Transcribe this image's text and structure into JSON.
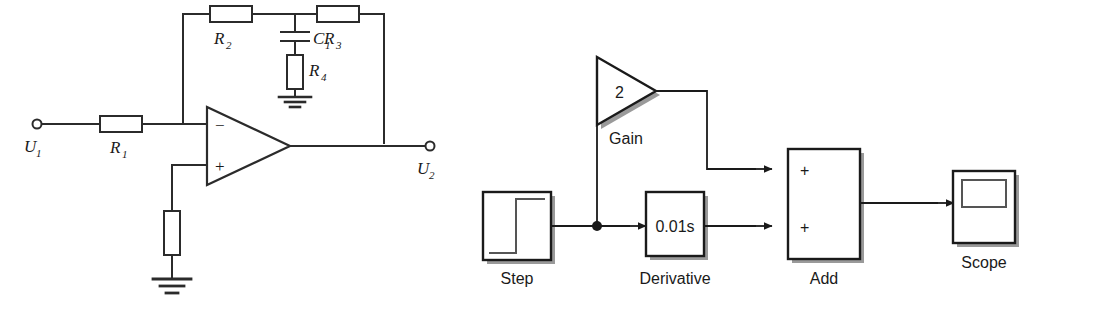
{
  "figure": {
    "background": "#ffffff",
    "line_color": "#2b2b2b",
    "shadow_color": "#9a9a9a",
    "panels": [
      "op-amp-circuit",
      "simulink-block-diagram"
    ]
  },
  "circuit": {
    "title": "Operational amplifier compensation network",
    "terminals": {
      "input_label": "U",
      "input_sub": "1",
      "output_label": "U",
      "output_sub": "2"
    },
    "components": [
      {
        "id": "R1",
        "name": "R",
        "sub": "1",
        "type": "resistor",
        "orientation": "horizontal"
      },
      {
        "id": "R2",
        "name": "R",
        "sub": "2",
        "type": "resistor",
        "orientation": "horizontal"
      },
      {
        "id": "R3",
        "name": "R",
        "sub": "3",
        "type": "resistor",
        "orientation": "horizontal"
      },
      {
        "id": "R4",
        "name": "R",
        "sub": "4",
        "type": "resistor",
        "orientation": "vertical"
      },
      {
        "id": "C1",
        "name": "C",
        "sub": "1",
        "type": "capacitor",
        "orientation": "vertical"
      },
      {
        "id": "Rg",
        "name": "",
        "sub": "",
        "type": "resistor",
        "orientation": "vertical"
      }
    ],
    "opamp": {
      "inverting_input": "−",
      "noninverting_input": "+"
    },
    "grounds": 2
  },
  "simulink": {
    "title": "Simulink block diagram",
    "blocks": [
      {
        "id": "step",
        "label": "Step",
        "icon": "step-waveform-icon",
        "value": ""
      },
      {
        "id": "gain",
        "label": "Gain",
        "icon": "triangle-gain-icon",
        "value": "2"
      },
      {
        "id": "derivative",
        "label": "Derivative",
        "icon": "rect-block-icon",
        "value": "0.01s"
      },
      {
        "id": "add",
        "label": "Add",
        "icon": "sum-block-icon",
        "value": ""
      },
      {
        "id": "scope",
        "label": "Scope",
        "icon": "scope-icon",
        "value": ""
      }
    ],
    "add_ports": [
      "+",
      "+"
    ],
    "signals": [
      {
        "from": "step",
        "to": "branch"
      },
      {
        "from": "branch",
        "to": "gain"
      },
      {
        "from": "branch",
        "to": "derivative"
      },
      {
        "from": "gain",
        "to": "add.in1"
      },
      {
        "from": "derivative",
        "to": "add.in2"
      },
      {
        "from": "add",
        "to": "scope"
      }
    ]
  }
}
